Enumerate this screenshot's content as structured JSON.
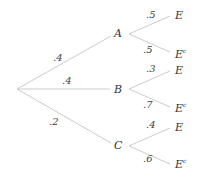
{
  "diagram": {
    "type": "probability-tree",
    "root": {
      "x": 17,
      "y": 89
    },
    "first_level": [
      {
        "node": "A",
        "prob": ".4",
        "x": 117,
        "y": 34
      },
      {
        "node": "B",
        "prob": ".4",
        "x": 117,
        "y": 89
      },
      {
        "node": "C",
        "prob": ".2",
        "x": 117,
        "y": 146
      }
    ],
    "second_level": [
      {
        "parent": "A",
        "branches": [
          {
            "outcome": "E",
            "prob": ".5"
          },
          {
            "outcome": "E",
            "sup": "c",
            "prob": ".5"
          }
        ]
      },
      {
        "parent": "B",
        "branches": [
          {
            "outcome": "E",
            "prob": ".3"
          },
          {
            "outcome": "E",
            "sup": "c",
            "prob": ".7"
          }
        ]
      },
      {
        "parent": "C",
        "branches": [
          {
            "outcome": "E",
            "prob": ".4"
          },
          {
            "outcome": "E",
            "sup": "c",
            "prob": ".6"
          }
        ]
      }
    ],
    "line_color": "#cccccc"
  }
}
